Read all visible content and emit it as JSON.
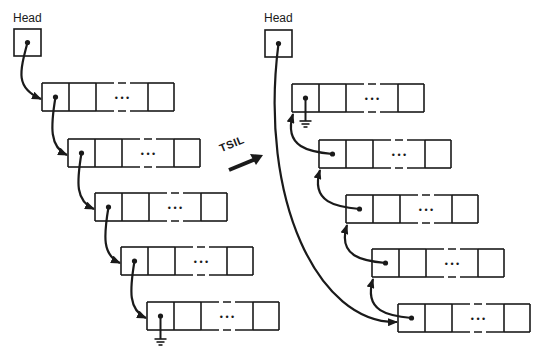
{
  "diagram": {
    "colors": {
      "ink": "#1a1a1a",
      "background": "#ffffff"
    },
    "transform_label": "TSIL",
    "left": {
      "head_label": "Head",
      "head_box": {
        "x": 14,
        "y": 29,
        "w": 27,
        "h": 27
      },
      "nodes": [
        {
          "x": 42,
          "y": 83,
          "terminal": false
        },
        {
          "x": 68,
          "y": 139,
          "terminal": false
        },
        {
          "x": 95,
          "y": 193,
          "terminal": false
        },
        {
          "x": 121,
          "y": 247,
          "terminal": false
        },
        {
          "x": 147,
          "y": 302,
          "terminal": true
        }
      ]
    },
    "right": {
      "head_label": "Head",
      "head_box": {
        "x": 265,
        "y": 30,
        "w": 27,
        "h": 27
      },
      "nodes": [
        {
          "x": 292,
          "y": 84,
          "terminal": true
        },
        {
          "x": 319,
          "y": 140,
          "terminal": false
        },
        {
          "x": 346,
          "y": 195,
          "terminal": false
        },
        {
          "x": 372,
          "y": 249,
          "terminal": false
        },
        {
          "x": 398,
          "y": 304,
          "terminal": false
        }
      ]
    },
    "node_shape": {
      "height": 28,
      "cells": [
        27,
        27,
        52,
        26
      ],
      "ellipsis": "• • •"
    }
  }
}
